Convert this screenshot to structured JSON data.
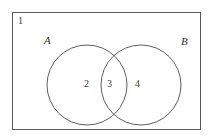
{
  "diagram": {
    "type": "venn-diagram",
    "title": "",
    "universe": {
      "label": "1",
      "name": "universal-set-rectangle",
      "description": "region outside both circles"
    },
    "sets": [
      {
        "label": "A",
        "name": "circle-a",
        "region_label": "2",
        "region_description": "A only"
      },
      {
        "label": "B",
        "name": "circle-b",
        "region_label": "4",
        "region_description": "B only"
      }
    ],
    "intersection": {
      "label": "3",
      "name": "intersection-a-b",
      "description": "A and B"
    },
    "geometry": {
      "rect": {
        "x": 12,
        "y": 12,
        "width": 189,
        "height": 118
      },
      "circle_a": {
        "cx": 87,
        "cy": 85,
        "r": 40
      },
      "circle_b": {
        "cx": 141,
        "cy": 85,
        "r": 40
      }
    },
    "colors": {
      "stroke": "#4a4a4a",
      "rect_stroke": "#5a5a5a",
      "background": "#ffffff",
      "text": "#333333"
    }
  }
}
